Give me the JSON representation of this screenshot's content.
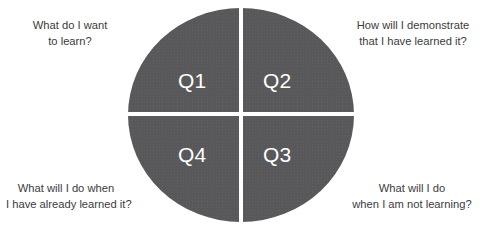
{
  "diagram": {
    "shape": "circle-divided-into-four-quadrants",
    "fill_color": "#58585a",
    "divider_color": "#ffffff",
    "quadrant_label_color": "#ffffff",
    "caption_color": "#3b3b3d",
    "background_color": "#ffffff"
  },
  "quadrants": [
    {
      "id": "q1",
      "label": "Q1",
      "position": "top-left",
      "caption_position": "top-left-outside",
      "caption_lines": [
        "What do I want",
        "to learn?"
      ]
    },
    {
      "id": "q2",
      "label": "Q2",
      "position": "top-right",
      "caption_position": "top-right-outside",
      "caption_lines": [
        "How will I demonstrate",
        "that I have learned it?"
      ]
    },
    {
      "id": "q3",
      "label": "Q3",
      "position": "bottom-right",
      "caption_position": "bottom-right-outside",
      "caption_lines": [
        "What will I do",
        "when I am not learning?"
      ]
    },
    {
      "id": "q4",
      "label": "Q4",
      "position": "bottom-left",
      "caption_position": "bottom-left-outside",
      "caption_lines": [
        "What will I do when",
        "I have already learned it?"
      ]
    }
  ]
}
